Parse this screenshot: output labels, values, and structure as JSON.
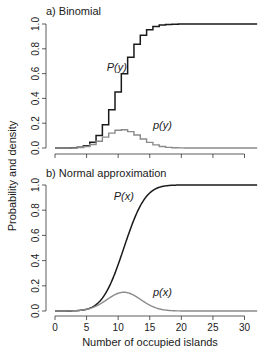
{
  "figure": {
    "ylabel": "Probability and density",
    "xlabel": "Number of occupied islands"
  },
  "chart_data": [
    {
      "type": "line",
      "title": "a) Binomial",
      "step": true,
      "x": [
        0,
        1,
        2,
        3,
        4,
        5,
        6,
        7,
        8,
        9,
        10,
        11,
        12,
        13,
        14,
        15,
        16,
        17,
        18,
        19,
        20,
        21,
        22,
        23,
        24,
        25,
        26,
        27,
        28,
        29,
        30,
        31,
        32
      ],
      "series": [
        {
          "name": "P(y)",
          "color": "#1a1a1a",
          "values": [
            0.0,
            0.0,
            0.0002,
            0.0014,
            0.0056,
            0.018,
            0.046,
            0.101,
            0.188,
            0.309,
            0.451,
            0.598,
            0.731,
            0.836,
            0.909,
            0.954,
            0.979,
            0.991,
            0.996,
            0.998,
            0.999,
            1,
            1,
            1,
            1,
            1,
            1,
            1,
            1,
            1,
            1,
            1,
            1
          ]
        },
        {
          "name": "p(y)",
          "color": "#8a8a8a",
          "values": [
            0.0,
            0.0,
            0.0002,
            0.0011,
            0.0043,
            0.012,
            0.028,
            0.054,
            0.088,
            0.12,
            0.143,
            0.147,
            0.132,
            0.105,
            0.073,
            0.045,
            0.025,
            0.012,
            0.005,
            0.002,
            0.001,
            0,
            0,
            0,
            0,
            0,
            0,
            0,
            0,
            0,
            0,
            0,
            0
          ]
        }
      ],
      "annotations": [
        {
          "text": "P(y)",
          "x": 8.2,
          "y": 0.62
        },
        {
          "text": "p(y)",
          "x": 15.5,
          "y": 0.15
        }
      ],
      "xlim": [
        0,
        32
      ],
      "ylim": [
        0,
        1
      ],
      "yticks": [
        "0.0",
        "0.2",
        "0.4",
        "0.6",
        "0.8",
        "1.0"
      ],
      "grid": false
    },
    {
      "type": "line",
      "title": "b) Normal approximation",
      "series": [
        {
          "name": "P(x)",
          "color": "#1a1a1a",
          "mean": 10.9,
          "sd": 2.68
        },
        {
          "name": "p(x)",
          "color": "#8a8a8a",
          "mean": 10.9,
          "sd": 2.68
        }
      ],
      "annotations": [
        {
          "text": "P(x)",
          "x": 9.3,
          "y": 0.88
        },
        {
          "text": "p(x)",
          "x": 15.5,
          "y": 0.12
        }
      ],
      "xlim": [
        0,
        32
      ],
      "ylim": [
        0,
        1
      ],
      "xticks": [
        "0",
        "5",
        "10",
        "15",
        "20",
        "25",
        "30"
      ],
      "yticks": [
        "0.0",
        "0.2",
        "0.4",
        "0.6",
        "0.8",
        "1.0"
      ],
      "xlabel": "Number of occupied islands",
      "grid": false
    }
  ]
}
